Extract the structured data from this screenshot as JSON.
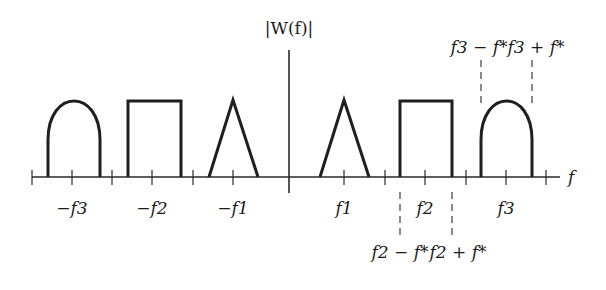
{
  "figure": {
    "y_label": "|W(f)|",
    "x_label": "f",
    "tick_labels": {
      "neg_f3": "−f3",
      "neg_f2": "−f2",
      "neg_f1": "−f1",
      "f1": "f1",
      "f2": "f2",
      "f3": "f3"
    },
    "annotations": {
      "f3_minus": "f3 − f*",
      "f3_plus": "f3 + f*",
      "f2_minus": "f2 − f*",
      "f2_plus": "f2 + f*"
    },
    "bands": [
      {
        "center": "-f3",
        "shape": "arch"
      },
      {
        "center": "-f2",
        "shape": "rectangle"
      },
      {
        "center": "-f1",
        "shape": "triangle"
      },
      {
        "center": "f1",
        "shape": "triangle"
      },
      {
        "center": "f2",
        "shape": "rectangle"
      },
      {
        "center": "f3",
        "shape": "arch"
      }
    ],
    "colors": {
      "stroke": "#1f1f1f",
      "background": "#ffffff"
    }
  }
}
